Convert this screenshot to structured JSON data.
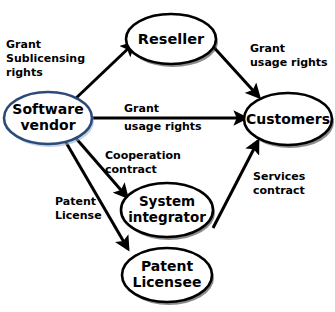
{
  "diagram": {
    "colors": {
      "background": "#ffffff",
      "node_stroke": "#000000",
      "accent_node_stroke": "#2a4a7a",
      "edge": "#000000",
      "text": "#000000"
    },
    "nodes": [
      {
        "id": "software-vendor",
        "label_line1": "Software",
        "label_line2": "vendor",
        "accent": true
      },
      {
        "id": "reseller",
        "label_line1": "Reseller",
        "label_line2": "",
        "accent": false
      },
      {
        "id": "customers",
        "label_line1": "Customers",
        "label_line2": "",
        "accent": false
      },
      {
        "id": "system-integrator",
        "label_line1": "System",
        "label_line2": "integrator",
        "accent": false
      },
      {
        "id": "patent-licensee",
        "label_line1": "Patent",
        "label_line2": "Licensee",
        "accent": false
      }
    ],
    "edges": [
      {
        "id": "vendor-to-reseller",
        "from": "software-vendor",
        "to": "reseller",
        "label_line1": "Grant",
        "label_line2": "Sublicensing",
        "label_line3": "rights"
      },
      {
        "id": "reseller-to-customers",
        "from": "reseller",
        "to": "customers",
        "label_line1": "Grant",
        "label_line2": "usage rights",
        "label_line3": ""
      },
      {
        "id": "vendor-to-customers",
        "from": "software-vendor",
        "to": "customers",
        "label_line1": "Grant",
        "label_line2": "usage rights",
        "label_line3": ""
      },
      {
        "id": "vendor-to-system-integrator",
        "from": "software-vendor",
        "to": "system-integrator",
        "label_line1": "Cooperation",
        "label_line2": "contract",
        "label_line3": ""
      },
      {
        "id": "vendor-to-patent-licensee",
        "from": "software-vendor",
        "to": "patent-licensee",
        "label_line1": "Patent",
        "label_line2": "License",
        "label_line3": ""
      },
      {
        "id": "system-integrator-to-customers",
        "from": "system-integrator",
        "to": "customers",
        "label_line1": "Services",
        "label_line2": "contract",
        "label_line3": ""
      }
    ]
  }
}
